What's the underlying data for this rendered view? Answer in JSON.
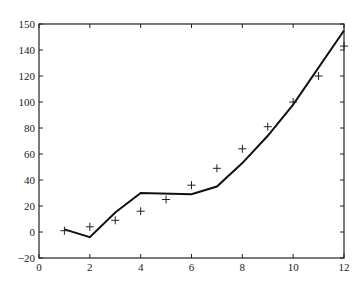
{
  "chart_data": {
    "type": "line",
    "title": "",
    "xlabel": "",
    "ylabel": "",
    "xlim": [
      0,
      12
    ],
    "ylim": [
      -20,
      160
    ],
    "grid": false,
    "legend": null,
    "x_ticks": [
      0,
      2,
      4,
      6,
      8,
      10,
      12
    ],
    "y_tick_labels": [
      "150",
      "140",
      "120",
      "100",
      "80",
      "60",
      "40",
      "20",
      "0",
      "-20"
    ],
    "series": [
      {
        "name": "fitted curve",
        "style": "solid-line",
        "x": [
          1,
          2,
          3,
          4,
          6,
          7,
          8,
          9,
          10,
          12
        ],
        "y": [
          2,
          -4,
          15,
          30,
          29,
          35,
          53,
          74,
          98,
          155
        ]
      },
      {
        "name": "observed data",
        "style": "plus-markers",
        "x": [
          1,
          2,
          3,
          4,
          5,
          6,
          7,
          8,
          9,
          10,
          11,
          12
        ],
        "y": [
          1,
          4,
          9,
          16,
          25,
          36,
          49,
          64,
          81,
          100,
          120,
          143
        ]
      }
    ]
  }
}
